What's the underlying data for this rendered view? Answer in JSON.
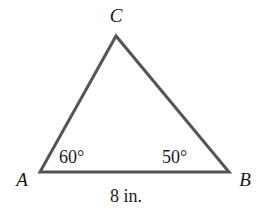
{
  "diagram": {
    "type": "triangle",
    "vertices": [
      {
        "label": "A",
        "x": 40,
        "y": 172
      },
      {
        "label": "B",
        "x": 229,
        "y": 172
      },
      {
        "label": "C",
        "x": 116,
        "y": 36
      }
    ],
    "angles": {
      "A": "60°",
      "B": "50°"
    },
    "sides": {
      "AB": "8 in."
    },
    "stroke_color": "#555555",
    "text_color": "#1a1a1a"
  }
}
